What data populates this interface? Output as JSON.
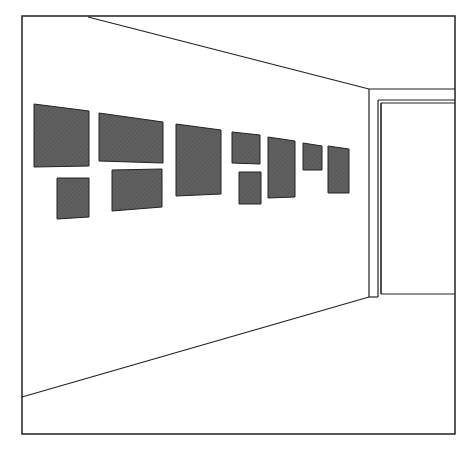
{
  "illustration": {
    "subject": "gallery corridor in perspective with framed pictures on left wall",
    "colors": {
      "background": "#ffffff",
      "line": "#222222",
      "picture_fill": "#5a5a5a"
    },
    "frame": {
      "x1": 22,
      "y1": 16,
      "x2": 455,
      "y2": 434
    },
    "ceiling_line": {
      "x1": 88,
      "y1": 17,
      "x2": 369,
      "y2": 89
    },
    "floor_line": {
      "x1": 22,
      "y1": 397,
      "x2": 369,
      "y2": 297
    },
    "end_wall": {
      "corner_x": 369,
      "top_y": 89,
      "bottom_y": 297,
      "door_outer_x": 378,
      "door_inner_x": 381,
      "door_top_outer_y": 100,
      "door_top_inner_y": 103,
      "door_bottom_y": 294,
      "right_x": 455
    },
    "pictures": [
      {
        "points": "34,104 89,111 89,166 34,167"
      },
      {
        "points": "99,113 163,122 163,163 99,161"
      },
      {
        "points": "57,178 89,178 89,217 57,219"
      },
      {
        "points": "112,170 162,169 162,207 112,211"
      },
      {
        "points": "176,124 221,130 221,194 176,196"
      },
      {
        "points": "232,132 260,135 260,164 232,163"
      },
      {
        "points": "239,172 261,172 261,204 239,204"
      },
      {
        "points": "268,137 295,141 295,197 268,198"
      },
      {
        "points": "303,143 322,146 322,170 303,170"
      },
      {
        "points": "328,146 349,149 349,193 328,193"
      }
    ]
  }
}
